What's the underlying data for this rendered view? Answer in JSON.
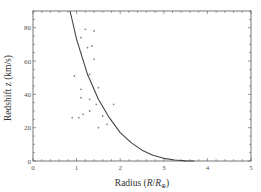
{
  "chart_data": {
    "type": "scatter",
    "title": "",
    "xlabel": "Radius (R/R⊕)",
    "xlabel_parts": {
      "main": "Radius (",
      "italic_r": "R",
      "slash": "/",
      "italic_r2": "R",
      "sub": "⊕",
      "close": ")"
    },
    "ylabel": "Redshift z (km/s)",
    "xlim": [
      0,
      5
    ],
    "ylim": [
      0,
      90
    ],
    "xticks": [
      0,
      1,
      2,
      3,
      4,
      5
    ],
    "yticks": [
      0,
      20,
      40,
      60,
      80
    ],
    "xtick_labels": [
      "0",
      "1",
      "2",
      "3",
      "4",
      "5"
    ],
    "ytick_labels": [
      "0",
      "20",
      "40",
      "60",
      "80"
    ],
    "grid": false,
    "legend": null,
    "series": [
      {
        "name": "observations",
        "kind": "scatter",
        "points": [
          [
            1.2,
            79
          ],
          [
            1.4,
            78
          ],
          [
            1.1,
            74
          ],
          [
            1.35,
            69
          ],
          [
            1.25,
            68
          ],
          [
            1.1,
            65
          ],
          [
            1.4,
            61
          ],
          [
            0.95,
            51
          ],
          [
            1.3,
            52
          ],
          [
            1.1,
            43
          ],
          [
            1.5,
            44
          ],
          [
            1.1,
            38
          ],
          [
            1.3,
            37
          ],
          [
            1.45,
            34
          ],
          [
            1.85,
            34
          ],
          [
            1.6,
            27
          ],
          [
            1.05,
            26
          ],
          [
            0.9,
            26
          ],
          [
            1.7,
            22
          ],
          [
            1.5,
            20
          ],
          [
            1.3,
            30
          ],
          [
            1.15,
            28
          ]
        ]
      },
      {
        "name": "model curve",
        "kind": "line",
        "points": [
          [
            0.85,
            90
          ],
          [
            1.0,
            73
          ],
          [
            1.25,
            52
          ],
          [
            1.5,
            37
          ],
          [
            1.75,
            26
          ],
          [
            2.0,
            17
          ],
          [
            2.25,
            11
          ],
          [
            2.5,
            6.5
          ],
          [
            2.75,
            3.5
          ],
          [
            3.0,
            1.6
          ],
          [
            3.25,
            0.6
          ],
          [
            3.5,
            0.1
          ],
          [
            3.7,
            0
          ]
        ]
      }
    ]
  },
  "colors": {
    "axis": "#555555",
    "points": "#888888",
    "curve": "#444444"
  }
}
